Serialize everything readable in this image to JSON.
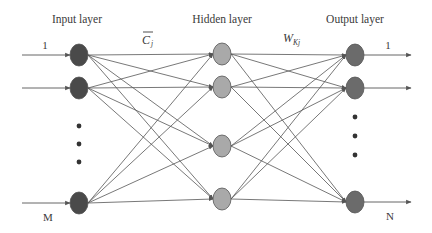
{
  "diagram": {
    "type": "feedforward-neural-network",
    "layers": [
      {
        "id": "input",
        "label": "Input layer",
        "x": 79,
        "node_color": "#4a4a4a",
        "node_ys": [
          55,
          88,
          203
        ],
        "ellipsis_ys": [
          126,
          144,
          162
        ],
        "first_label": "1",
        "last_label": "M"
      },
      {
        "id": "hidden",
        "label": "Hidden layer",
        "x": 222,
        "node_color": "#a9a9a9",
        "node_ys": [
          54,
          87,
          146,
          199
        ]
      },
      {
        "id": "output",
        "label": "Output layer",
        "x": 355,
        "node_color": "#6b6b6b",
        "node_ys": [
          55,
          88,
          202
        ],
        "ellipsis_ys": [
          117,
          136,
          155
        ],
        "first_label": "1",
        "last_label": "N"
      }
    ],
    "weights": {
      "input_to_hidden": {
        "symbol": "C",
        "subscript": "j",
        "overline": true
      },
      "hidden_to_output": {
        "symbol": "W",
        "subscript": "Kj",
        "overline": false
      }
    },
    "edge_color": "#555555",
    "node_stroke": "#555555"
  }
}
